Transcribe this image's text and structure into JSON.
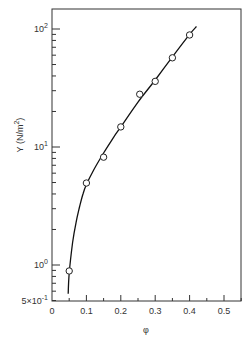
{
  "chart_data": {
    "type": "line",
    "title": "",
    "xlabel": "φ",
    "ylabel": "Y (N/m²)",
    "ylabel_parts": {
      "base": "Y (N/m",
      "sup": "2",
      "close": ")"
    },
    "xscale": "linear",
    "yscale": "log",
    "xlim": [
      0,
      0.55
    ],
    "ylim": [
      0.5,
      150
    ],
    "grid": false,
    "legend": "none",
    "x_ticks": [
      {
        "value": 0,
        "label": "0"
      },
      {
        "value": 0.1,
        "label": "0.1"
      },
      {
        "value": 0.2,
        "label": "0.2"
      },
      {
        "value": 0.3,
        "label": "0.3"
      },
      {
        "value": 0.4,
        "label": "0.4"
      },
      {
        "value": 0.5,
        "label": "0.5"
      }
    ],
    "y_ticks": [
      {
        "value": 0.5,
        "label_base": "5×10",
        "label_sup": "-1"
      },
      {
        "value": 1,
        "label_base": "10",
        "label_sup": "0"
      },
      {
        "value": 10,
        "label_base": "10",
        "label_sup": "1"
      },
      {
        "value": 100,
        "label_base": "10",
        "label_sup": "2"
      }
    ],
    "series": [
      {
        "name": "measured",
        "style": "open-circle",
        "x": [
          0.05,
          0.1,
          0.15,
          0.2,
          0.255,
          0.3,
          0.35,
          0.4
        ],
        "y": [
          0.89,
          4.95,
          8.2,
          14.8,
          28,
          36,
          57,
          89
        ]
      },
      {
        "name": "fit",
        "style": "solid-line",
        "x": [
          0.047,
          0.05,
          0.06,
          0.07,
          0.08,
          0.09,
          0.1,
          0.12,
          0.15,
          0.18,
          0.2,
          0.25,
          0.3,
          0.35,
          0.4,
          0.42
        ],
        "y": [
          0.57,
          0.85,
          1.55,
          2.3,
          3.1,
          4.0,
          4.8,
          6.3,
          8.9,
          12.2,
          14.8,
          24,
          37,
          58,
          90,
          105
        ]
      }
    ]
  }
}
